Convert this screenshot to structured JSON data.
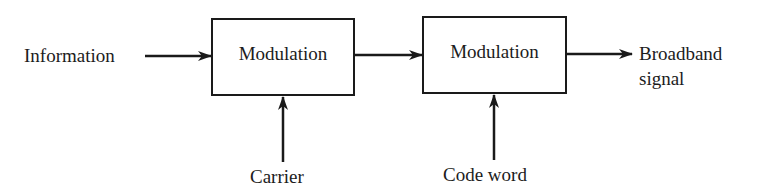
{
  "diagram": {
    "type": "block-diagram",
    "direction": "left-to-right",
    "nodes": [
      {
        "id": "information",
        "kind": "input-label",
        "label": "Information"
      },
      {
        "id": "mod1",
        "kind": "block",
        "label": "Modulation"
      },
      {
        "id": "carrier",
        "kind": "input-label",
        "label": "Carrier"
      },
      {
        "id": "mod2",
        "kind": "block",
        "label": "Modulation"
      },
      {
        "id": "codeword",
        "kind": "input-label",
        "label": "Code word"
      },
      {
        "id": "output",
        "kind": "output-label",
        "label_line1": "Broadband",
        "label_line2": "signal"
      }
    ],
    "edges": [
      {
        "from": "information",
        "to": "mod1"
      },
      {
        "from": "carrier",
        "to": "mod1"
      },
      {
        "from": "mod1",
        "to": "mod2"
      },
      {
        "from": "codeword",
        "to": "mod2"
      },
      {
        "from": "mod2",
        "to": "output"
      }
    ]
  },
  "labels": {
    "information": "Information",
    "block1": "Modulation",
    "carrier": "Carrier",
    "block2": "Modulation",
    "codeword": "Code word",
    "output_line1": "Broadband",
    "output_line2": "signal"
  },
  "colors": {
    "stroke": "#1a1a1a",
    "text": "#1c1c1c",
    "background": "#ffffff"
  }
}
